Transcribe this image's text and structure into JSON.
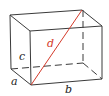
{
  "diagram": {
    "type": "rectangular-box-space-diagonal",
    "colors": {
      "edge": "#3a3a3a",
      "diagonal": "#d43a2a",
      "label": "#222222"
    },
    "labels": {
      "a": "a",
      "b": "b",
      "c": "c",
      "d": "d"
    }
  }
}
